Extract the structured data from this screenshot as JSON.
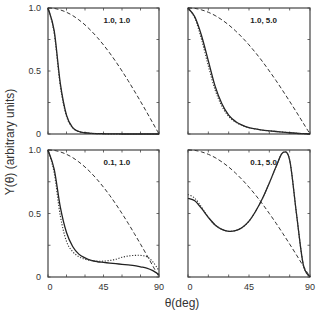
{
  "chart_data": {
    "type": "line",
    "title": "",
    "ylabel": "Y(θ) (arbitrary units)",
    "xlabel": "θ(deg)",
    "xlim": [
      0,
      90
    ],
    "ylim": [
      0,
      1.0
    ],
    "x_ticks": [
      "0",
      "45",
      "90"
    ],
    "y_ticks": [
      "0",
      "0.5",
      "1.0"
    ],
    "grid": false,
    "legend": null,
    "layout": "2x2 panels",
    "line_styles": {
      "solid": "#222222",
      "dotted": "#333333",
      "dashed": "#333333"
    },
    "x": [
      0,
      5,
      10,
      15,
      20,
      25,
      30,
      35,
      40,
      45,
      50,
      55,
      60,
      65,
      70,
      75,
      80,
      85,
      90
    ],
    "panels": [
      {
        "label": "1.0, 1.0",
        "series": [
          {
            "name": "solid",
            "style": "solid",
            "values": [
              1.0,
              0.82,
              0.4,
              0.15,
              0.05,
              0.02,
              0.01,
              0.005,
              0.003,
              0.002,
              0.001,
              0.001,
              0,
              0,
              0,
              0,
              0,
              0,
              0
            ]
          },
          {
            "name": "dotted",
            "style": "dotted",
            "values": [
              1.0,
              0.8,
              0.38,
              0.14,
              0.05,
              0.02,
              0.01,
              0.005,
              0.003,
              0.002,
              0.001,
              0.001,
              0,
              0,
              0,
              0,
              0,
              0,
              0
            ]
          },
          {
            "name": "dashed",
            "style": "dashed",
            "values": [
              1.0,
              0.997,
              0.985,
              0.966,
              0.94,
              0.906,
              0.866,
              0.819,
              0.766,
              0.707,
              0.643,
              0.574,
              0.5,
              0.423,
              0.342,
              0.259,
              0.174,
              0.087,
              0.0
            ]
          }
        ]
      },
      {
        "label": "1.0, 5.0",
        "series": [
          {
            "name": "solid",
            "style": "solid",
            "values": [
              1.0,
              0.93,
              0.78,
              0.58,
              0.38,
              0.24,
              0.15,
              0.1,
              0.07,
              0.05,
              0.04,
              0.03,
              0.025,
              0.02,
              0.015,
              0.01,
              0.006,
              0.003,
              0.0
            ]
          },
          {
            "name": "dotted",
            "style": "dotted",
            "values": [
              1.0,
              0.92,
              0.75,
              0.54,
              0.35,
              0.22,
              0.14,
              0.095,
              0.068,
              0.05,
              0.04,
              0.03,
              0.025,
              0.02,
              0.015,
              0.01,
              0.006,
              0.003,
              0.0
            ]
          },
          {
            "name": "dashed",
            "style": "dashed",
            "values": [
              1.0,
              0.997,
              0.985,
              0.966,
              0.94,
              0.906,
              0.866,
              0.819,
              0.766,
              0.707,
              0.643,
              0.574,
              0.5,
              0.423,
              0.342,
              0.259,
              0.174,
              0.087,
              0.0
            ]
          }
        ]
      },
      {
        "label": "0.1, 1.0",
        "series": [
          {
            "name": "solid",
            "style": "solid",
            "values": [
              1.0,
              0.85,
              0.55,
              0.35,
              0.24,
              0.18,
              0.15,
              0.13,
              0.12,
              0.115,
              0.11,
              0.105,
              0.1,
              0.095,
              0.09,
              0.08,
              0.07,
              0.05,
              0.02
            ]
          },
          {
            "name": "dotted",
            "style": "dotted",
            "values": [
              1.0,
              0.82,
              0.48,
              0.28,
              0.2,
              0.16,
              0.14,
              0.13,
              0.125,
              0.125,
              0.13,
              0.14,
              0.155,
              0.165,
              0.17,
              0.17,
              0.16,
              0.12,
              0.05
            ]
          },
          {
            "name": "dashed",
            "style": "dashed",
            "values": [
              1.0,
              0.997,
              0.985,
              0.966,
              0.94,
              0.906,
              0.866,
              0.819,
              0.766,
              0.707,
              0.643,
              0.574,
              0.5,
              0.423,
              0.342,
              0.259,
              0.174,
              0.087,
              0.0
            ]
          }
        ]
      },
      {
        "label": "0.1, 5.0",
        "series": [
          {
            "name": "solid",
            "style": "solid",
            "values": [
              0.62,
              0.6,
              0.54,
              0.47,
              0.41,
              0.375,
              0.36,
              0.365,
              0.39,
              0.44,
              0.52,
              0.62,
              0.74,
              0.87,
              0.98,
              0.92,
              0.5,
              0.1,
              0.0
            ]
          },
          {
            "name": "dotted",
            "style": "dotted",
            "values": [
              0.65,
              0.62,
              0.55,
              0.47,
              0.41,
              0.375,
              0.36,
              0.365,
              0.39,
              0.44,
              0.52,
              0.62,
              0.74,
              0.87,
              0.98,
              0.92,
              0.5,
              0.1,
              0.0
            ]
          },
          {
            "name": "dashed",
            "style": "dashed",
            "values": [
              1.0,
              0.997,
              0.985,
              0.966,
              0.94,
              0.906,
              0.866,
              0.819,
              0.766,
              0.707,
              0.643,
              0.574,
              0.5,
              0.423,
              0.342,
              0.259,
              0.174,
              0.087,
              0.0
            ]
          }
        ]
      }
    ]
  },
  "axes": {
    "ylabel": "Y(θ) (arbitrary units)",
    "xlabel": "θ(deg)",
    "x_ticks": [
      "0",
      "45",
      "90"
    ],
    "y_ticks": [
      "0",
      "0.5",
      "1.0"
    ]
  },
  "panels": [
    {
      "label": "1.0, 1.0"
    },
    {
      "label": "1.0, 5.0"
    },
    {
      "label": "0.1, 1.0"
    },
    {
      "label": "0.1, 5.0"
    }
  ]
}
